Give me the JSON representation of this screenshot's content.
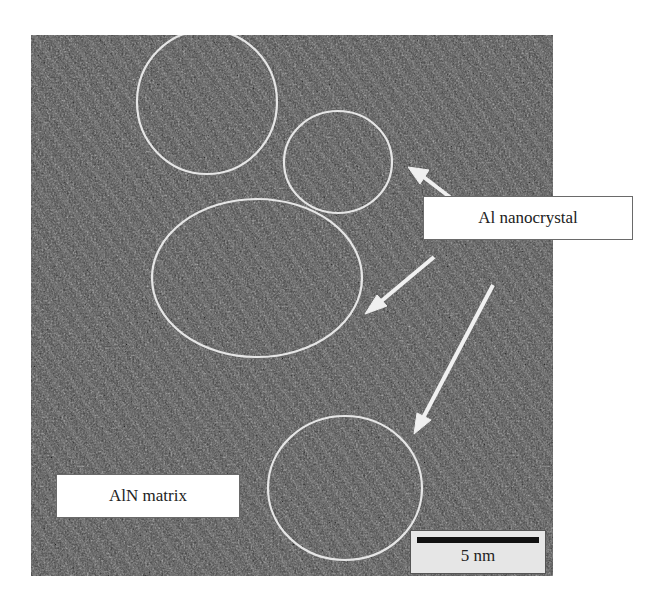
{
  "figure": {
    "type": "TEM micrograph",
    "labels": {
      "nanocrystal": "Al nanocrystal",
      "matrix": "AlN matrix"
    },
    "scale_bar": {
      "text": "5 nm"
    },
    "colors": {
      "background": "#4a4a4a",
      "annotation": "#e8e8e8"
    }
  }
}
